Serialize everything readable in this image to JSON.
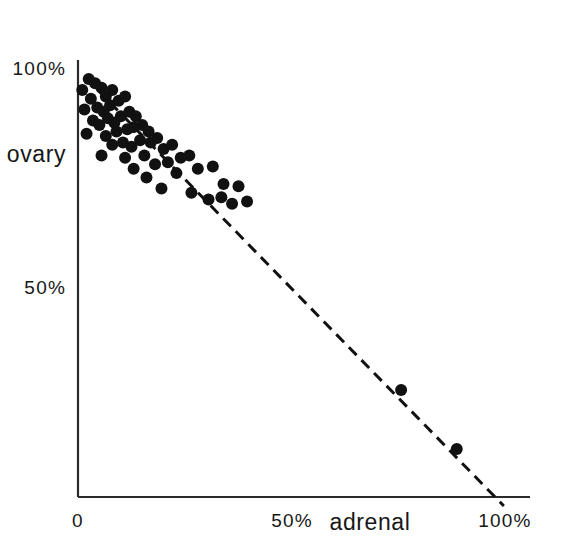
{
  "chart_data": {
    "type": "scatter",
    "title": "",
    "subtitle": "",
    "xlabel": "adrenal",
    "ylabel": "ovary",
    "xlim": [
      0,
      108
    ],
    "ylim": [
      0,
      104
    ],
    "grid": false,
    "legend": "none",
    "x_ticks": [
      {
        "value": 0,
        "label": "0"
      },
      {
        "value": 50,
        "label": "50%"
      },
      {
        "value": 100,
        "label": "100%"
      }
    ],
    "y_ticks": [
      {
        "value": 50,
        "label": "50%"
      },
      {
        "value": 100,
        "label": "100%"
      }
    ],
    "annotations": [
      {
        "name": "sum-to-100-reference-line",
        "style": "dashed",
        "color": "#111111",
        "x_start": 1.6,
        "y_start": 98.0,
        "x_end": 99.5,
        "y_end": 0.0
      }
    ],
    "marker": {
      "shape": "circle",
      "color": "#111111",
      "size_px": 12
    },
    "series": [
      {
        "name": "samples",
        "points": [
          [
            1.0,
            95.0
          ],
          [
            2.5,
            97.5
          ],
          [
            4.0,
            96.5
          ],
          [
            5.5,
            95.5
          ],
          [
            3.0,
            93.0
          ],
          [
            6.5,
            93.5
          ],
          [
            8.0,
            95.0
          ],
          [
            1.5,
            90.5
          ],
          [
            4.5,
            91.0
          ],
          [
            6.0,
            90.0
          ],
          [
            7.5,
            91.5
          ],
          [
            9.5,
            92.5
          ],
          [
            11.0,
            93.5
          ],
          [
            3.5,
            88.0
          ],
          [
            5.0,
            87.0
          ],
          [
            7.0,
            88.5
          ],
          [
            8.5,
            87.5
          ],
          [
            10.0,
            89.0
          ],
          [
            12.0,
            90.0
          ],
          [
            13.5,
            89.0
          ],
          [
            2.0,
            85.0
          ],
          [
            6.5,
            84.5
          ],
          [
            9.0,
            85.5
          ],
          [
            11.5,
            86.0
          ],
          [
            13.0,
            86.5
          ],
          [
            15.0,
            87.0
          ],
          [
            16.5,
            85.5
          ],
          [
            8.0,
            82.5
          ],
          [
            10.5,
            83.0
          ],
          [
            12.5,
            82.0
          ],
          [
            14.5,
            83.5
          ],
          [
            17.0,
            83.0
          ],
          [
            18.5,
            84.0
          ],
          [
            5.5,
            80.0
          ],
          [
            11.0,
            79.5
          ],
          [
            15.5,
            80.0
          ],
          [
            20.0,
            81.5
          ],
          [
            22.0,
            82.5
          ],
          [
            13.0,
            77.0
          ],
          [
            18.0,
            78.0
          ],
          [
            21.0,
            78.5
          ],
          [
            24.0,
            79.5
          ],
          [
            26.0,
            80.0
          ],
          [
            16.0,
            75.0
          ],
          [
            23.0,
            76.0
          ],
          [
            28.0,
            77.0
          ],
          [
            31.5,
            77.5
          ],
          [
            19.5,
            72.5
          ],
          [
            26.5,
            71.5
          ],
          [
            34.0,
            73.5
          ],
          [
            37.5,
            73.0
          ],
          [
            30.5,
            70.0
          ],
          [
            33.5,
            70.5
          ],
          [
            36.0,
            69.0
          ],
          [
            39.5,
            69.5
          ],
          [
            75.5,
            26.5
          ],
          [
            88.5,
            13.0
          ]
        ]
      }
    ]
  },
  "axes": {
    "x_axis_name": "adrenal-axis",
    "y_axis_name": "ovary-axis"
  }
}
